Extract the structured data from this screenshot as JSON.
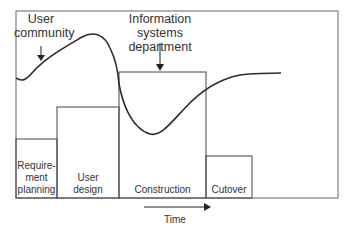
{
  "diagram": {
    "annotations": {
      "user_community": [
        "User",
        "community"
      ],
      "is_department": [
        "Information systems",
        "department"
      ]
    },
    "phases": [
      {
        "label_lines": [
          "Require-",
          "ment",
          "planning"
        ]
      },
      {
        "label_lines": [
          "User",
          "design"
        ]
      },
      {
        "label_lines": [
          "Construction"
        ]
      },
      {
        "label_lines": [
          "Cutover"
        ]
      }
    ],
    "axis_label": "Time",
    "colors": {
      "line": "#2a2a2a",
      "frame": "#555555"
    }
  }
}
